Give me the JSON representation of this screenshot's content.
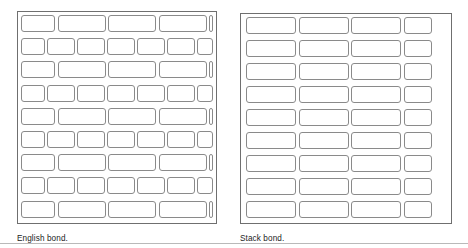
{
  "figure": {
    "background_color": "#ffffff",
    "line_color": "#8a8a8a",
    "frame_color": "#6f6f6f",
    "caption_color": "#1c1c1c"
  },
  "panels": [
    {
      "id": "english-bond",
      "caption": "English bond.",
      "bond_type": "English bond",
      "description": "Alternating courses of stretchers and headers",
      "x": 17,
      "y": 11,
      "width": 200,
      "height": 213,
      "rows": 9,
      "row_types": [
        "stretcher",
        "header",
        "stretcher",
        "header",
        "stretcher",
        "header",
        "stretcher",
        "header",
        "stretcher"
      ],
      "stretcher_brick_width": 48,
      "header_brick_width": 28,
      "caption_x": 17,
      "caption_y": 234
    },
    {
      "id": "stack-bond",
      "caption": "Stack bond.",
      "bond_type": "Stack bond",
      "description": "All courses aligned vertically with no stagger",
      "x": 240,
      "y": 13,
      "width": 212,
      "height": 211,
      "rows": 9,
      "columns": 4,
      "full_brick_width": 50,
      "partial_brick_width": 28,
      "caption_x": 240,
      "caption_y": 234
    }
  ],
  "geometry": {
    "english": {
      "pad": 4,
      "row_height": 23.2,
      "brick_height": 17,
      "mortar": 2.6,
      "stretcher_unit": 50.5,
      "header_unit": 30.0,
      "stretcher_offset": -14,
      "header_offset": -4
    },
    "stack": {
      "pad": 4,
      "row_height": 23.0,
      "brick_height": 17,
      "col_unit": 52.5,
      "col_offset": 2
    }
  },
  "baseline": {
    "y": 243
  }
}
